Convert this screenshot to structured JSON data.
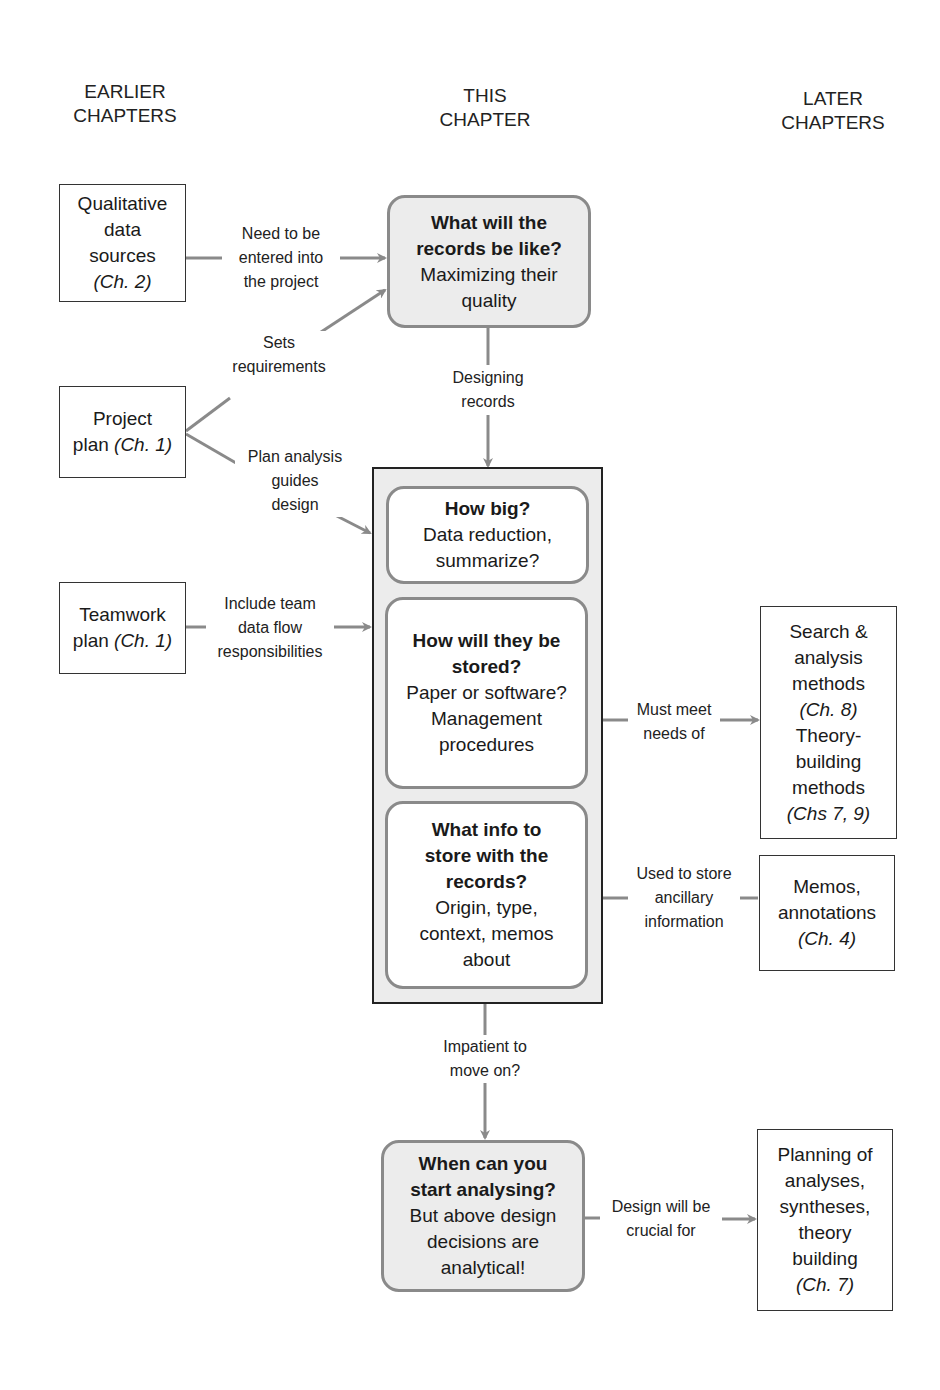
{
  "column_headers": {
    "earlier": [
      "EARLIER",
      "CHAPTERS"
    ],
    "this": [
      "THIS",
      "CHAPTER"
    ],
    "later": [
      "LATER",
      "CHAPTERS"
    ]
  },
  "left_boxes": {
    "qualitative": {
      "lines": [
        "Qualitative",
        "data",
        "sources"
      ],
      "ref": "(Ch. 2)"
    },
    "project_plan": {
      "line1": "Project",
      "line2": "plan",
      "ref": "(Ch. 1)"
    },
    "teamwork_plan": {
      "line1": "Teamwork",
      "line2": "plan",
      "ref": "(Ch. 1)"
    }
  },
  "center": {
    "records_like": {
      "title": [
        "What will the",
        "records be like?"
      ],
      "body": [
        "Maximizing their",
        "quality"
      ]
    },
    "how_big": {
      "title": "How big?",
      "body": [
        "Data reduction,",
        "summarize?"
      ]
    },
    "how_stored": {
      "title": [
        "How will they be",
        "stored?"
      ],
      "body": [
        "Paper or software?",
        "Management",
        "procedures"
      ]
    },
    "what_info": {
      "title": [
        "What info to",
        "store with the",
        "records?"
      ],
      "body": [
        "Origin, type,",
        "context, memos",
        "about"
      ]
    },
    "when_analyse": {
      "title": [
        "When can you",
        "start analysing?"
      ],
      "body": [
        "But above design",
        "decisions are",
        "analytical!"
      ]
    }
  },
  "right_boxes": {
    "search_analysis": {
      "lines1": [
        "Search &",
        "analysis",
        "methods"
      ],
      "ref1": "(Ch. 8)",
      "lines2": [
        "Theory-",
        "building",
        "methods"
      ],
      "ref2": "(Chs 7, 9)"
    },
    "memos": {
      "lines": [
        "Memos,",
        "annotations"
      ],
      "ref": "(Ch. 4)"
    },
    "planning": {
      "lines": [
        "Planning of",
        "analyses,",
        "syntheses,",
        "theory",
        "building"
      ],
      "ref": "(Ch. 7)"
    }
  },
  "edge_labels": {
    "entered": [
      "Need to be",
      "entered into",
      "the project"
    ],
    "sets_req": [
      "Sets",
      "requirements"
    ],
    "plan_analysis": [
      "Plan analysis",
      "guides",
      "design"
    ],
    "team_flow": [
      "Include team",
      "data flow",
      "responsibilities"
    ],
    "designing": [
      "Designing",
      "records"
    ],
    "must_meet": [
      "Must meet",
      "needs of"
    ],
    "used_store": [
      "Used to store",
      "ancillary",
      "information"
    ],
    "impatient": [
      "Impatient to",
      "move on?"
    ],
    "crucial": [
      "Design will be",
      "crucial for"
    ]
  },
  "colors": {
    "arrow": "#8a8a8a",
    "shaded_fill": "#ececec",
    "border_dark": "#222222"
  }
}
